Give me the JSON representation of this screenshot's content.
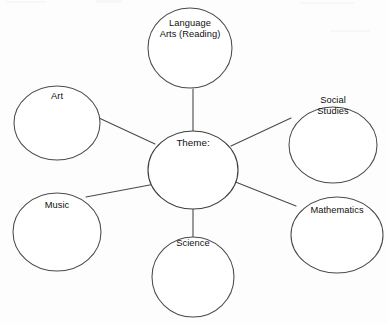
{
  "diagram": {
    "center": {
      "id": "theme",
      "label": "Theme:",
      "cx": 193,
      "cy": 170,
      "rx": 45,
      "ry": 39,
      "label_lines": [
        "Theme:"
      ],
      "label_y": 143
    },
    "stroke_color": "#4a4a4a",
    "fill_color": "#ffffff",
    "text_color": "#101010",
    "background_color": "#fdfdfd",
    "nodes": [
      {
        "id": "language-arts",
        "label": "Language Arts (Reading)",
        "label_lines": [
          "Language",
          "Arts (Reading)"
        ],
        "cx": 190,
        "cy": 48,
        "rx": 42,
        "ry": 40,
        "label_y": 24,
        "line_gap": 11
      },
      {
        "id": "social-studies",
        "label": "Social Studies",
        "label_lines": [
          "Social",
          "Studies"
        ],
        "cx": 333,
        "cy": 145,
        "rx": 44,
        "ry": 38,
        "label_y": 101,
        "line_gap": 11
      },
      {
        "id": "mathematics",
        "label": "Mathematics",
        "label_lines": [
          "Mathematics"
        ],
        "cx": 337,
        "cy": 235,
        "rx": 46,
        "ry": 38,
        "label_y": 211,
        "line_gap": 11
      },
      {
        "id": "science",
        "label": "Science",
        "label_lines": [
          "Science"
        ],
        "cx": 193,
        "cy": 277,
        "rx": 41,
        "ry": 40,
        "label_y": 244,
        "line_gap": 11
      },
      {
        "id": "music",
        "label": "Music",
        "label_lines": [
          "Music"
        ],
        "cx": 57,
        "cy": 232,
        "rx": 44,
        "ry": 39,
        "label_y": 206,
        "line_gap": 11
      },
      {
        "id": "art",
        "label": "Art",
        "label_lines": [
          "Art"
        ],
        "cx": 57,
        "cy": 123,
        "rx": 43,
        "ry": 37,
        "label_y": 97,
        "line_gap": 11
      }
    ],
    "connectors": [
      {
        "id": "theme-to-language-arts",
        "from": "theme",
        "to": "language-arts",
        "x1": 193,
        "y1": 131,
        "x2": 193,
        "y2": 89
      },
      {
        "id": "theme-to-social-studies",
        "from": "theme",
        "to": "social-studies",
        "x1": 231,
        "y1": 146,
        "x2": 291,
        "y2": 118
      },
      {
        "id": "theme-to-mathematics",
        "from": "theme",
        "to": "mathematics",
        "x1": 233,
        "y1": 181,
        "x2": 296,
        "y2": 206
      },
      {
        "id": "theme-to-science",
        "from": "theme",
        "to": "science",
        "x1": 193,
        "y1": 208,
        "x2": 193,
        "y2": 238
      },
      {
        "id": "theme-to-music",
        "from": "theme",
        "to": "music",
        "x1": 155,
        "y1": 184,
        "x2": 86,
        "y2": 197
      },
      {
        "id": "theme-to-art",
        "from": "theme",
        "to": "art",
        "x1": 155,
        "y1": 144,
        "x2": 99,
        "y2": 118
      }
    ]
  }
}
